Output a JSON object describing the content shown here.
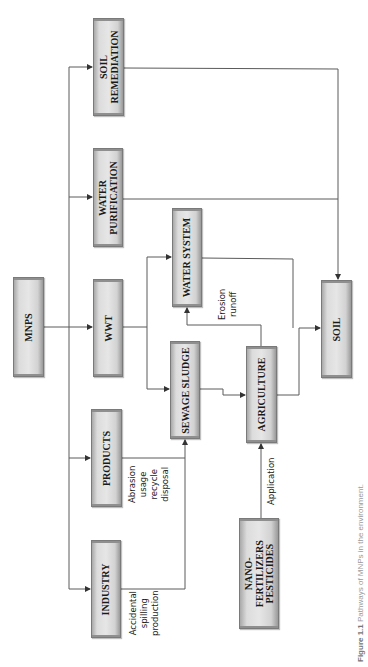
{
  "diagram": {
    "orientation": "rotated-90-ccw",
    "colors": {
      "box_fill": "#e0e0e0",
      "box_border": "#7a7a7a",
      "line": "#555555",
      "text": "#1a1a1a"
    },
    "nodes": {
      "mnps": {
        "label": "MNPS"
      },
      "soil_remediation": {
        "label": "SOIL\nREMEDIATION"
      },
      "water_purification": {
        "label": "WATER\nPURIFICATION"
      },
      "wwt": {
        "label": "WWT"
      },
      "products": {
        "label": "PRODUCTS"
      },
      "industry": {
        "label": "INDUSTRY"
      },
      "water_system": {
        "label": "WATER SYSTEM"
      },
      "sewage_sludge": {
        "label": "SEWAGE SLUDGE"
      },
      "agriculture": {
        "label": "AGRICULTURE"
      },
      "nano": {
        "label": "NANO-\nFERTILIZERS\nPESTICIDES"
      },
      "soil": {
        "label": "SOIL"
      }
    },
    "edge_labels": {
      "products_to_sludge": "Abrasion\nusage\nrecycle\ndisposal",
      "industry_to_sludge": "Accidental\nspilling\nproduction",
      "agriculture_to_water": "Erosion\nrunoff",
      "nano_to_agriculture": "Application"
    },
    "edges": [
      {
        "from": "MNPS",
        "to": "SOIL REMEDIATION"
      },
      {
        "from": "MNPS",
        "to": "WATER PURIFICATION"
      },
      {
        "from": "MNPS",
        "to": "WWT"
      },
      {
        "from": "MNPS",
        "to": "PRODUCTS"
      },
      {
        "from": "MNPS",
        "to": "INDUSTRY"
      },
      {
        "from": "SOIL REMEDIATION",
        "to": "SOIL"
      },
      {
        "from": "WATER PURIFICATION",
        "to": "SOIL"
      },
      {
        "from": "WWT",
        "to": "WATER SYSTEM"
      },
      {
        "from": "WWT",
        "to": "SEWAGE SLUDGE"
      },
      {
        "from": "PRODUCTS",
        "to": "SEWAGE SLUDGE",
        "label": "Abrasion usage recycle disposal"
      },
      {
        "from": "INDUSTRY",
        "to": "SEWAGE SLUDGE",
        "label": "Accidental spilling production"
      },
      {
        "from": "SEWAGE SLUDGE",
        "to": "AGRICULTURE"
      },
      {
        "from": "AGRICULTURE",
        "to": "WATER SYSTEM",
        "label": "Erosion runoff"
      },
      {
        "from": "AGRICULTURE",
        "to": "SOIL"
      },
      {
        "from": "WATER SYSTEM",
        "to": "SOIL"
      },
      {
        "from": "NANO-FERTILIZERS PESTICIDES",
        "to": "AGRICULTURE",
        "label": "Application"
      }
    ],
    "caption": {
      "prefix": "Figure 1.1",
      "text": "Pathways of MNPs in the environment."
    }
  }
}
